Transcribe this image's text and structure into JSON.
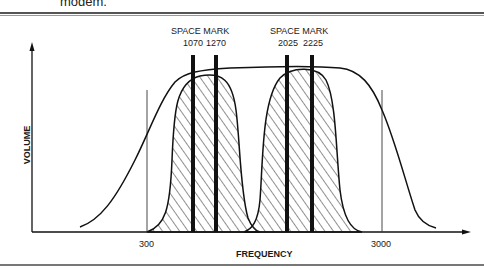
{
  "caption": {
    "tail_text": "modem."
  },
  "figure": {
    "y_axis_label": "VOLUME",
    "x_axis_label": "FREQUENCY",
    "x_ticks": [
      {
        "label": "300",
        "x": 147
      },
      {
        "label": "3000",
        "x": 382
      }
    ],
    "channel_groups": [
      {
        "header": "SPACE MARK",
        "frequencies": [
          "1070",
          "1270"
        ],
        "bars_x": [
          193,
          216
        ]
      },
      {
        "header": "SPACE MARK",
        "frequencies": [
          "2025",
          "2225"
        ],
        "bars_x": [
          287,
          312
        ]
      }
    ],
    "colors": {
      "ink": "#111111",
      "hatch": "#333333",
      "background": "#ffffff"
    }
  }
}
